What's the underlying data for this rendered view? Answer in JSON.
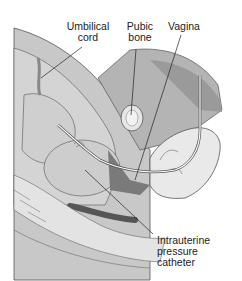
{
  "figure": {
    "labels": {
      "umbilical_cord": [
        "Umbilical",
        "cord"
      ],
      "pubic_bone": [
        "Pubic",
        "bone"
      ],
      "vagina": "Vagina",
      "catheter": [
        "Intrauterine",
        "pressure",
        "catheter"
      ]
    }
  }
}
